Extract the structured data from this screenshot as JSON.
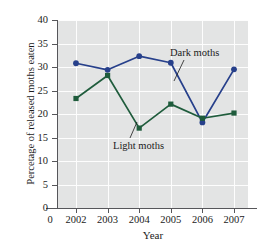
{
  "chart_data": {
    "type": "line",
    "title": "",
    "xlabel": "Year",
    "ylabel": "Percetage of released moths eaten",
    "categories": [
      "2002",
      "2003",
      "2004",
      "2005",
      "2006",
      "2007"
    ],
    "x_tick_labels": [
      "0",
      "2002",
      "2003",
      "2004",
      "2005",
      "2006",
      "2007"
    ],
    "y_tick_labels": [
      "0",
      "5",
      "10",
      "15",
      "20",
      "25",
      "30",
      "35",
      "40"
    ],
    "ylim": [
      0,
      40
    ],
    "y_tick_step": 5,
    "grid": true,
    "legend_position": "inline-annotations",
    "series": [
      {
        "name": "Dark moths",
        "color": "#27408b",
        "marker": "circle",
        "values": [
          30.8,
          29.4,
          32.3,
          30.9,
          18.2,
          29.5
        ]
      },
      {
        "name": "Light moths",
        "color": "#1f5c3c",
        "marker": "square",
        "values": [
          23.3,
          28.2,
          17.0,
          22.1,
          19.1,
          20.2
        ]
      }
    ],
    "annotations": [
      {
        "text": "Dark moths",
        "series": "Dark moths"
      },
      {
        "text": "Light moths",
        "series": "Light moths"
      }
    ]
  },
  "colors": {
    "plot_background": "#e3e4e4",
    "gridline": "#fdfdfd",
    "axis": "#56565a",
    "dark_series": "#27408b",
    "light_series": "#1f5c3c",
    "text": "#1b1b1b"
  }
}
